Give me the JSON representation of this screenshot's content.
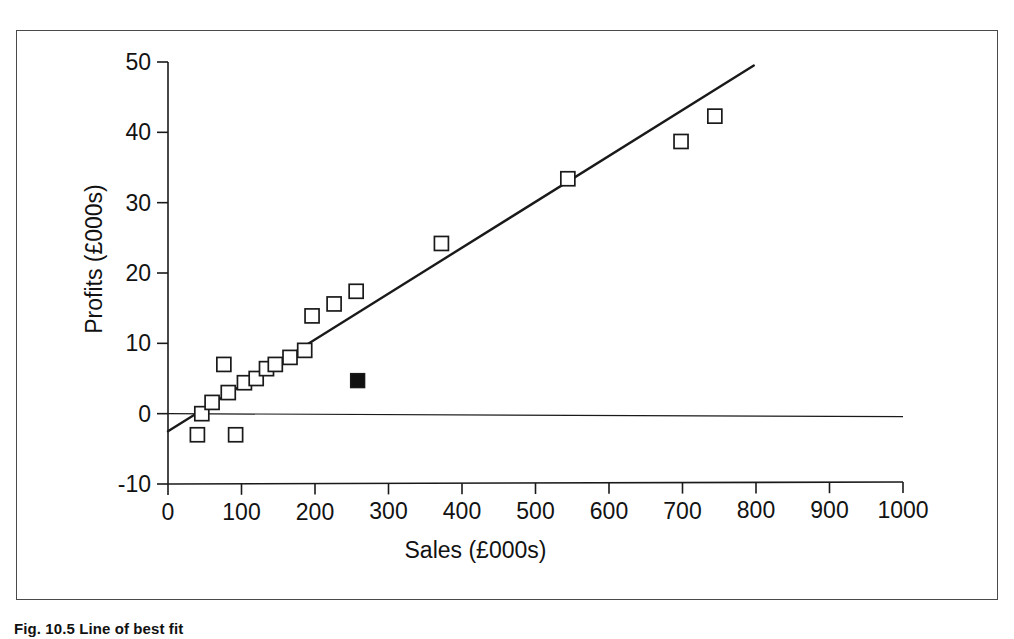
{
  "figure": {
    "caption": "Fig. 10.5 Line of best fit",
    "frame_color": "#4a4a4a",
    "background": "#ffffff"
  },
  "chart_data": {
    "type": "scatter",
    "title": "",
    "xlabel": "Sales (£000s)",
    "ylabel": "Profits (£000s)",
    "xlim": [
      0,
      1000
    ],
    "ylim": [
      -10,
      50
    ],
    "xticks": [
      0,
      100,
      200,
      300,
      400,
      500,
      600,
      700,
      800,
      900,
      1000
    ],
    "yticks": [
      -10,
      0,
      10,
      20,
      30,
      40,
      50
    ],
    "xtick_labels": [
      "0",
      "100",
      "200",
      "300",
      "400",
      "500",
      "600",
      "700",
      "800",
      "900",
      "1000"
    ],
    "ytick_labels": [
      "-10",
      "0",
      "10",
      "20",
      "30",
      "40",
      "50"
    ],
    "grid": false,
    "legend": false,
    "marker_style": "open-square",
    "marker_color": "#ffffff",
    "marker_edge_color": "#1a1a1a",
    "series": [
      {
        "name": "Observations",
        "marker": "open-square",
        "points": [
          {
            "x": 40,
            "y": -3.0
          },
          {
            "x": 46,
            "y": 0.0
          },
          {
            "x": 60,
            "y": 1.6
          },
          {
            "x": 76,
            "y": 7.0
          },
          {
            "x": 82,
            "y": 3.0
          },
          {
            "x": 92,
            "y": -3.0
          },
          {
            "x": 104,
            "y": 4.4
          },
          {
            "x": 120,
            "y": 5.0
          },
          {
            "x": 134,
            "y": 6.4
          },
          {
            "x": 146,
            "y": 7.0
          },
          {
            "x": 166,
            "y": 8.0
          },
          {
            "x": 186,
            "y": 9.0
          },
          {
            "x": 196,
            "y": 13.9
          },
          {
            "x": 226,
            "y": 15.6
          },
          {
            "x": 256,
            "y": 17.4
          },
          {
            "x": 372,
            "y": 24.2
          },
          {
            "x": 544,
            "y": 33.4
          },
          {
            "x": 698,
            "y": 38.7
          },
          {
            "x": 744,
            "y": 42.3
          }
        ]
      },
      {
        "name": "Highlighted observation",
        "marker": "filled-square",
        "marker_color": "#111111",
        "points": [
          {
            "x": 258,
            "y": 4.7
          }
        ]
      }
    ],
    "trend_line": {
      "name": "Line of best fit",
      "x_start": 0,
      "y_start": -2.5,
      "x_end": 797,
      "y_end": 49.5,
      "color": "#1a1a1a",
      "width": 2.4
    },
    "zero_line": {
      "name": "Zero profit reference line",
      "y": 0,
      "x_start": 0,
      "x_end": 1000,
      "color": "#1a1a1a",
      "width": 1.2
    }
  }
}
